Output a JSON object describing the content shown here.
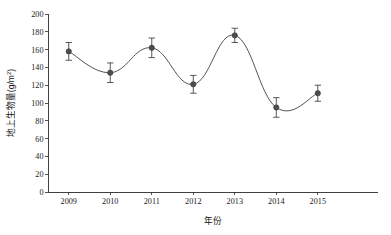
{
  "chart_data": {
    "type": "line",
    "title": "",
    "xlabel": "年份",
    "ylabel": "地上生物量(g/m²)",
    "ylabel_main": "地上生物量(g/m",
    "ylabel_sup": "2",
    "ylabel_tail": ")",
    "categories": [
      "2009",
      "2010",
      "2011",
      "2012",
      "2013",
      "2014",
      "2015"
    ],
    "x": [
      2009,
      2010,
      2011,
      2012,
      2013,
      2014,
      2015
    ],
    "values": [
      158,
      134,
      162,
      121,
      176,
      95,
      111
    ],
    "errors": [
      10,
      11,
      11,
      10,
      8,
      11,
      9
    ],
    "error_type": "symmetric",
    "ylim": [
      0,
      200
    ],
    "ytick_step": 20,
    "yticks": [
      0,
      20,
      40,
      60,
      80,
      100,
      120,
      140,
      160,
      180,
      200
    ],
    "ytick_labels": [
      "0",
      "20",
      "40",
      "60",
      "80",
      "100",
      "120",
      "140",
      "160",
      "180",
      "200"
    ],
    "xtick_labels": [
      "2009",
      "2010",
      "2011",
      "2012",
      "2013",
      "2014",
      "2015"
    ],
    "grid": false,
    "legend": null,
    "legend_position": "none",
    "marker": "filled-circle",
    "line_style": "smooth-spline",
    "series_color": "#4a4a4a",
    "marker_color": "#4d4d4d",
    "axis_color": "#2b2b2b",
    "background_color": "#ffffff"
  },
  "layout": {
    "plot_left": 48,
    "plot_right": 378,
    "plot_top": 14,
    "plot_bottom": 192
  }
}
